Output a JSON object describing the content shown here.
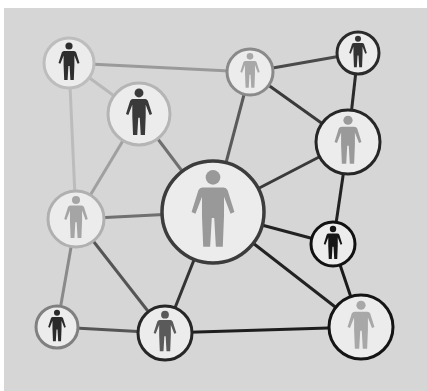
{
  "diagram": {
    "title": "",
    "type": "social-network",
    "background_color": "#d6d6d6",
    "node_fill": "#ececec",
    "nodes": [
      {
        "id": "n1",
        "cx": 69,
        "cy": 63,
        "r": 25,
        "border": "#bdbdbd",
        "figure": "#2e2e2e",
        "icon": "person-icon"
      },
      {
        "id": "n2",
        "cx": 139,
        "cy": 114,
        "r": 31,
        "border": "#b5b5b5",
        "figure": "#3a3a3a",
        "icon": "person-icon"
      },
      {
        "id": "n3",
        "cx": 250,
        "cy": 72,
        "r": 23,
        "border": "#8a8a8a",
        "figure": "#a8a8a8",
        "icon": "person-icon"
      },
      {
        "id": "n4",
        "cx": 358,
        "cy": 53,
        "r": 21,
        "border": "#2a2a2a",
        "figure": "#333333",
        "icon": "person-icon"
      },
      {
        "id": "n5",
        "cx": 348,
        "cy": 142,
        "r": 32,
        "border": "#262626",
        "figure": "#9a9a9a",
        "icon": "person-icon"
      },
      {
        "id": "n6",
        "cx": 76,
        "cy": 219,
        "r": 28,
        "border": "#b0b0b0",
        "figure": "#a5a5a5",
        "icon": "person-icon"
      },
      {
        "id": "n7",
        "cx": 213,
        "cy": 212,
        "r": 51,
        "border": "#3c3c3c",
        "figure": "#999999",
        "icon": "person-icon"
      },
      {
        "id": "n8",
        "cx": 333,
        "cy": 244,
        "r": 22,
        "border": "#111111",
        "figure": "#151515",
        "icon": "person-icon"
      },
      {
        "id": "n9",
        "cx": 57,
        "cy": 327,
        "r": 21,
        "border": "#808080",
        "figure": "#2a2a2a",
        "icon": "person-icon"
      },
      {
        "id": "n10",
        "cx": 165,
        "cy": 333,
        "r": 27,
        "border": "#262626",
        "figure": "#5a5a5a",
        "icon": "person-icon"
      },
      {
        "id": "n11",
        "cx": 361,
        "cy": 327,
        "r": 32,
        "border": "#141414",
        "figure": "#a8a8a8",
        "icon": "person-icon"
      }
    ],
    "edges": [
      {
        "from": "n1",
        "to": "n3",
        "color": "#9a9a9a"
      },
      {
        "from": "n1",
        "to": "n2",
        "color": "#b8b8b8"
      },
      {
        "from": "n1",
        "to": "n6",
        "color": "#bcbcbc"
      },
      {
        "from": "n2",
        "to": "n6",
        "color": "#a0a0a0"
      },
      {
        "from": "n2",
        "to": "n7",
        "color": "#707070"
      },
      {
        "from": "n3",
        "to": "n4",
        "color": "#4a4a4a"
      },
      {
        "from": "n3",
        "to": "n7",
        "color": "#5a5a5a"
      },
      {
        "from": "n3",
        "to": "n5",
        "color": "#3a3a3a"
      },
      {
        "from": "n4",
        "to": "n5",
        "color": "#2a2a2a"
      },
      {
        "from": "n5",
        "to": "n7",
        "color": "#3a3a3a"
      },
      {
        "from": "n5",
        "to": "n8",
        "color": "#222222"
      },
      {
        "from": "n6",
        "to": "n7",
        "color": "#707070"
      },
      {
        "from": "n6",
        "to": "n9",
        "color": "#8a8a8a"
      },
      {
        "from": "n6",
        "to": "n10",
        "color": "#555555"
      },
      {
        "from": "n7",
        "to": "n10",
        "color": "#333333"
      },
      {
        "from": "n7",
        "to": "n8",
        "color": "#222222"
      },
      {
        "from": "n7",
        "to": "n11",
        "color": "#222222"
      },
      {
        "from": "n8",
        "to": "n11",
        "color": "#1a1a1a"
      },
      {
        "from": "n9",
        "to": "n10",
        "color": "#555555"
      },
      {
        "from": "n10",
        "to": "n11",
        "color": "#1e1e1e"
      }
    ]
  }
}
